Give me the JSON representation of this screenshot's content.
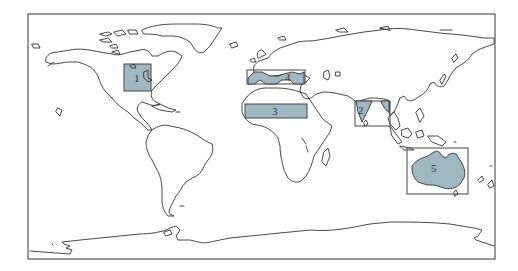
{
  "map": {
    "projection": "world",
    "land_fill": "#ffffff",
    "region_fill": "#9fb8c2",
    "outline_color": "#333333",
    "frame": {
      "x": 28,
      "y": 14,
      "width": 467,
      "height": 245
    }
  },
  "regions": [
    {
      "id": 1,
      "label": "1",
      "name": "North America (central US)",
      "box": {
        "x": 124,
        "y": 64,
        "width": 27,
        "height": 27
      },
      "label_pos": {
        "x": 136,
        "y": 81
      },
      "style": "filled"
    },
    {
      "id": 2,
      "label": "2",
      "name": "India",
      "box": {
        "x": 355,
        "y": 101,
        "width": 35,
        "height": 25
      },
      "label_pos": {
        "x": 360,
        "y": 115
      },
      "style": "hollow"
    },
    {
      "id": 3,
      "label": "3",
      "name": "Sahara",
      "box": {
        "x": 245,
        "y": 104,
        "width": 62,
        "height": 14
      },
      "label_pos": {
        "x": 272,
        "y": 115
      },
      "style": "filled"
    },
    {
      "id": 4,
      "label": "4",
      "name": "Mediterranean",
      "box": {
        "x": 247,
        "y": 70,
        "width": 58,
        "height": 14
      },
      "label_pos": {
        "x": 286,
        "y": 80
      },
      "style": "hollow"
    },
    {
      "id": 5,
      "label": "5",
      "name": "Australia",
      "box": {
        "x": 407,
        "y": 148,
        "width": 61,
        "height": 46
      },
      "label_pos": {
        "x": 431,
        "y": 171
      },
      "style": "hollow"
    }
  ]
}
